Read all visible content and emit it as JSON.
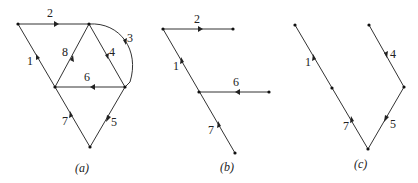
{
  "figure": {
    "panels": [
      {
        "id": "a",
        "caption": "(a)",
        "nodes": [
          {
            "id": "A",
            "x": 18,
            "y": 24
          },
          {
            "id": "B",
            "x": 89,
            "y": 24
          },
          {
            "id": "C",
            "x": 55,
            "y": 87
          },
          {
            "id": "D",
            "x": 125,
            "y": 87
          },
          {
            "id": "E",
            "x": 90,
            "y": 147
          }
        ],
        "edges": [
          {
            "label": "1",
            "from": "C",
            "to": "A"
          },
          {
            "label": "2",
            "from": "A",
            "to": "B"
          },
          {
            "label": "3",
            "from": "B",
            "to": "D",
            "curved": true
          },
          {
            "label": "4",
            "from": "B",
            "to": "D"
          },
          {
            "label": "5",
            "from": "D",
            "to": "E"
          },
          {
            "label": "6",
            "from": "D",
            "to": "C"
          },
          {
            "label": "7",
            "from": "E",
            "to": "C"
          },
          {
            "label": "8",
            "from": "C",
            "to": "B"
          }
        ]
      },
      {
        "id": "b",
        "caption": "(b)",
        "edges": [
          {
            "label": "1"
          },
          {
            "label": "2"
          },
          {
            "label": "6"
          },
          {
            "label": "7"
          }
        ]
      },
      {
        "id": "c",
        "caption": "(c)",
        "edges": [
          {
            "label": "1"
          },
          {
            "label": "4"
          },
          {
            "label": "5"
          },
          {
            "label": "7"
          }
        ]
      }
    ]
  },
  "labels": {
    "a": {
      "e1": "1",
      "e2": "2",
      "e3": "3",
      "e4": "4",
      "e5": "5",
      "e6": "6",
      "e7": "7",
      "e8": "8",
      "caption": "(a)"
    },
    "b": {
      "e1": "1",
      "e2": "2",
      "e6": "6",
      "e7": "7",
      "caption": "(b)"
    },
    "c": {
      "e1": "1",
      "e4": "4",
      "e5": "5",
      "e7": "7",
      "caption": "(c)"
    }
  },
  "colors": {
    "line": "#333333",
    "node": "#111111",
    "background": "#ffffff"
  }
}
